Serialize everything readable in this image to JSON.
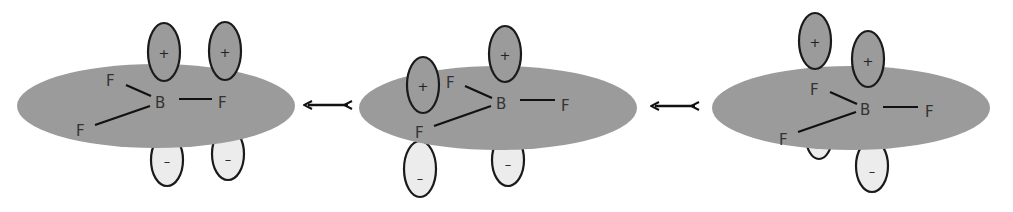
{
  "figure": {
    "colors": {
      "background": "#ffffff",
      "plane": "#9b9b9b",
      "positive_lobe": "#9b9b9b",
      "negative_lobe": "#ececec",
      "outline": "#1a1a1a",
      "bond": "#111111",
      "text": "#333333"
    },
    "labels": {
      "central_atom": "B",
      "ligand": "F",
      "positive_sign": "+",
      "negative_sign": "–",
      "resonance_arrow": "↔"
    },
    "structures": [
      {
        "name": "structure-1",
        "description": "p-orbital lobes on B and F (upper-left)"
      },
      {
        "name": "structure-2",
        "description": "p-orbital lobes on B and F (lower-left)"
      },
      {
        "name": "structure-3",
        "description": "p-orbital lobes on B and F (right)"
      }
    ],
    "arrows": [
      {
        "name": "resonance-arrow-1",
        "between": [
          "structure-1",
          "structure-2"
        ]
      },
      {
        "name": "resonance-arrow-2",
        "between": [
          "structure-2",
          "structure-3"
        ]
      }
    ]
  }
}
